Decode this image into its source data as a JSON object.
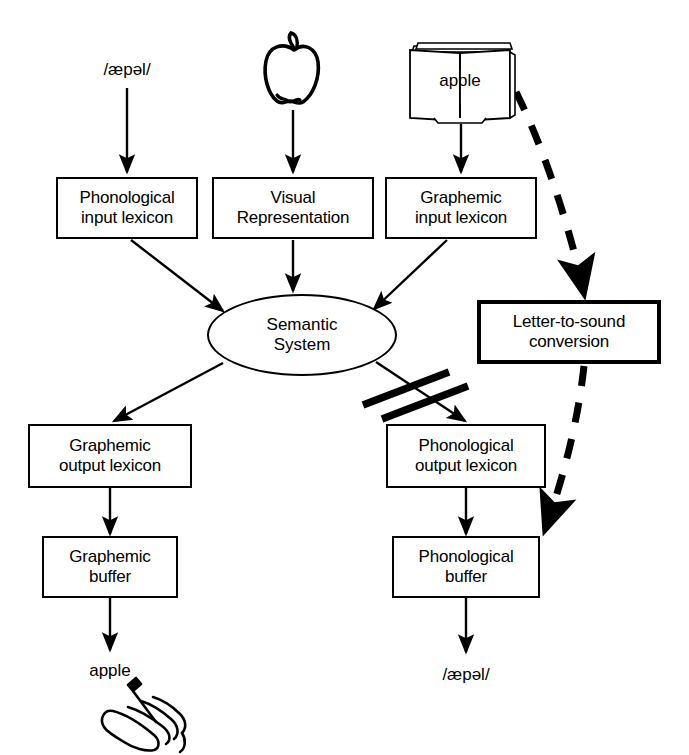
{
  "diagram": {
    "background_color": "#ffffff",
    "stroke_color": "#000000"
  },
  "inputs": {
    "spoken_word": "/æpəl/",
    "picture_icon": "apple-outline-icon",
    "written_word_icon": "open-book-icon",
    "written_word": "apple"
  },
  "boxes": [
    {
      "id": "phonological-input-lexicon",
      "line1": "Phonological",
      "line2": "input lexicon"
    },
    {
      "id": "visual-representation",
      "line1": "Visual",
      "line2": "Representation"
    },
    {
      "id": "graphemic-input-lexicon",
      "line1": "Graphemic",
      "line2": "input lexicon"
    },
    {
      "id": "letter-to-sound-conversion",
      "line1": "Letter-to-sound",
      "line2": "conversion"
    },
    {
      "id": "graphemic-output-lexicon",
      "line1": "Graphemic",
      "line2": "output lexicon"
    },
    {
      "id": "phonological-output-lexicon",
      "line1": "Phonological",
      "line2": "output lexicon"
    },
    {
      "id": "graphemic-buffer",
      "line1": "Graphemic",
      "line2": "buffer"
    },
    {
      "id": "phonological-buffer",
      "line1": "Phonological",
      "line2": "buffer"
    }
  ],
  "semantic_system": {
    "line1": "Semantic",
    "line2": "System"
  },
  "outputs": {
    "written_output": "apple",
    "writing_icon": "hand-writing-with-pen-icon",
    "spoken_output": "/æpəl/"
  },
  "annotations": {
    "blocked_pathway": "double-slash-block-marks",
    "blocked_pathway_from": "Semantic System",
    "blocked_pathway_to": "Phonological output lexicon"
  }
}
